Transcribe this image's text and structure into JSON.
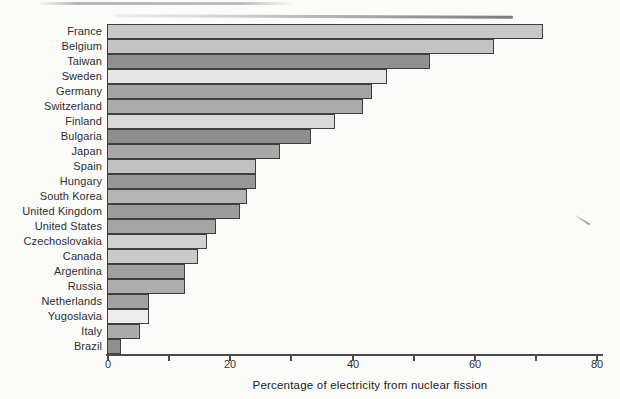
{
  "figure": {
    "background": "#fbfbf9",
    "bar_border_color": "#3f3f3f",
    "axis_color": "#4a4a4a"
  },
  "chart_data": {
    "type": "bar",
    "orientation": "horizontal",
    "title": "",
    "xlabel": "Percentage of electricity from nuclear fission",
    "ylabel": "",
    "xlim": [
      0,
      80
    ],
    "x_ticks_major": [
      0,
      20,
      40,
      60,
      80
    ],
    "x_ticks_minor": [
      10,
      30,
      50,
      70
    ],
    "x_tick_labels": [
      "0",
      "20",
      "40",
      "60",
      "80"
    ],
    "grid": false,
    "legend": false,
    "categories": [
      "France",
      "Belgium",
      "Taiwan",
      "Sweden",
      "Germany",
      "Switzerland",
      "Finland",
      "Bulgaria",
      "Japan",
      "Spain",
      "Hungary",
      "South Korea",
      "United Kingdom",
      "United States",
      "Czechoslovakia",
      "Canada",
      "Argentina",
      "Russia",
      "Netherlands",
      "Yugoslavia",
      "Italy",
      "Brazil"
    ],
    "values": [
      71,
      63,
      52.5,
      45.5,
      43,
      41.5,
      37,
      33,
      28,
      24,
      24,
      22.5,
      21.5,
      17.5,
      16,
      14.5,
      12.5,
      12.5,
      6.5,
      6.5,
      5,
      2
    ],
    "bar_colors": [
      "#c8c8c6",
      "#c4c4c2",
      "#90908e",
      "#e5e5e3",
      "#a3a3a1",
      "#ababa9",
      "#d9d9d7",
      "#8e8e8c",
      "#a8a8a6",
      "#c1c1bf",
      "#979795",
      "#b5b5b3",
      "#9c9c9a",
      "#a5a5a3",
      "#d1d1cf",
      "#cacac8",
      "#a0a09e",
      "#adadab",
      "#a2a2a0",
      "#ececea",
      "#aaaaa8",
      "#8f8f8d"
    ]
  }
}
